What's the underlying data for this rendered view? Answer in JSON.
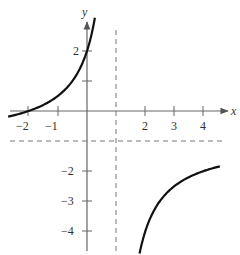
{
  "chart_data": {
    "type": "line",
    "title": "",
    "function": "f(x) = -(x+2)/(x-1)",
    "xlabel": "x",
    "ylabel": "y",
    "xlim": [
      -2.9,
      4.8
    ],
    "ylim": [
      -4.7,
      3.0
    ],
    "grid": false,
    "legend": null,
    "x_ticks": [
      {
        "value": -2,
        "label": "−2"
      },
      {
        "value": -1,
        "label": "−1"
      },
      {
        "value": 2,
        "label": "2"
      },
      {
        "value": 3,
        "label": "3"
      },
      {
        "value": 4,
        "label": "4"
      }
    ],
    "y_ticks": [
      {
        "value": 2,
        "label": "2"
      },
      {
        "value": 1,
        "label": ""
      },
      {
        "value": -2,
        "label": "−2"
      },
      {
        "value": -3,
        "label": "−3"
      },
      {
        "value": -4,
        "label": "−4"
      }
    ],
    "asymptotes": [
      {
        "type": "vertical",
        "value": 1,
        "style": "dashed"
      },
      {
        "type": "horizontal",
        "value": -1,
        "style": "dashed"
      }
    ],
    "series": [
      {
        "name": "left-branch",
        "x": [
          -2.7,
          -2,
          -1.5,
          -1,
          -0.5,
          0,
          0.2,
          0.3
        ],
        "y": [
          -0.19,
          0,
          0.2,
          0.5,
          1.0,
          2.0,
          2.75,
          3.29
        ]
      },
      {
        "name": "right-branch",
        "x": [
          1.8,
          2,
          2.5,
          3,
          3.5,
          4,
          4.5
        ],
        "y": [
          -4.75,
          -4.0,
          -3.0,
          -2.5,
          -2.2,
          -2.0,
          -1.86
        ]
      }
    ]
  },
  "axes": {
    "x_label": "x",
    "y_label": "y"
  }
}
